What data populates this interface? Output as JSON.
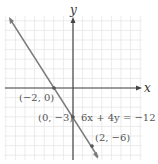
{
  "chart_data": {
    "type": "line",
    "title": "",
    "xlabel": "x",
    "ylabel": "y",
    "equation": "6x + 4y = −12",
    "grid": true,
    "xlim": [
      -7,
      7
    ],
    "ylim": [
      -7,
      7.5
    ],
    "series": [
      {
        "name": "6x + 4y = −12",
        "x": [
          -6.8,
          2.8
        ],
        "y": [
          7.2,
          -7.2
        ],
        "color": "#7a7a7a"
      }
    ],
    "points": [
      {
        "x": -2,
        "y": 0,
        "label": "(−2, 0)"
      },
      {
        "x": 0,
        "y": -3,
        "label": "(0, −3)"
      },
      {
        "x": 2,
        "y": -6,
        "label": "(2, −6)"
      }
    ]
  },
  "labels": {
    "x_axis": "x",
    "y_axis": "y",
    "equation": "6x + 4y = −12",
    "p1": "(−2, 0)",
    "p2": "(0, −3)",
    "p3": "(2, −6)"
  },
  "colors": {
    "grid": "#e6e6e6",
    "axis": "#444444",
    "line": "#7a7a7a",
    "text": "#555555"
  }
}
